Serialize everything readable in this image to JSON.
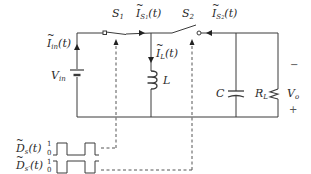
{
  "diagram": {
    "components": {
      "source": {
        "name": "V",
        "sub": "in"
      },
      "switch1": {
        "name": "S",
        "sub": "1"
      },
      "switch2": {
        "name": "S",
        "sub": "2"
      },
      "inductor": {
        "name": "L"
      },
      "capacitor": {
        "name": "C"
      },
      "load": {
        "name": "R",
        "sub": "L"
      },
      "output": {
        "name": "V",
        "sub": "o",
        "minus": "−",
        "plus": "+"
      }
    },
    "currents": {
      "i_in": {
        "name": "I",
        "sub": "in",
        "arg": "(t)"
      },
      "i_s1": {
        "name": "I",
        "sub": "S",
        "subsub": "1",
        "arg": "(t)"
      },
      "i_l": {
        "name": "I",
        "sub": "L",
        "arg": "(t)"
      },
      "i_s2": {
        "name": "I",
        "sub": "S",
        "subsub": "2",
        "arg": "(t)"
      }
    },
    "switching_functions": [
      {
        "name": "D",
        "sub": "s",
        "prime": "",
        "arg": "(t)",
        "high": "1",
        "low": "0"
      },
      {
        "name": "D",
        "sub": "s",
        "prime": "′",
        "arg": "(t)",
        "high": "1",
        "low": "0"
      }
    ],
    "colors": {
      "wire": "#3a3a3a",
      "dashed": "#555555",
      "text": "#2a2a2a"
    }
  }
}
